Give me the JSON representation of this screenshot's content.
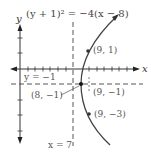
{
  "figure": {
    "title_equation": "(y + 1)² = −4(x − 8)",
    "axes": {
      "x_label": "x",
      "y_label": "y"
    },
    "lines": {
      "horizontal_dashed_label": "y = −1",
      "vertical_dashed_label": "x = 7"
    },
    "points": [
      {
        "label": "(9, 1)",
        "x": 9,
        "y": 1
      },
      {
        "label": "(8, −1)",
        "x": 8,
        "y": -1
      },
      {
        "label": "(9, −1)",
        "x": 9,
        "y": -1
      },
      {
        "label": "(9, −3)",
        "x": 9,
        "y": -3
      }
    ],
    "note": "The labels are transcribed as printed. They are mutually inconsistent: a vertex at (8, -1) on a left-opening parabola cannot pass through (9, 1) or (9, -3)."
  },
  "colors": {
    "curve": "#444444",
    "axes": "#333333",
    "dashed": "#555555",
    "text": "#555555"
  }
}
